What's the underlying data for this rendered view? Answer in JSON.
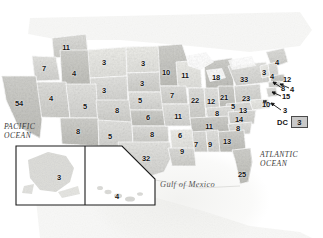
{
  "map": {
    "title": "United States Electoral College Map",
    "geo_labels": [
      {
        "name": "pacific-ocean",
        "line1": "PACIFIC",
        "line2": "OCEAN",
        "x": 4,
        "y": 122
      },
      {
        "name": "atlantic-ocean",
        "line1": "ATLANTIC",
        "line2": "OCEAN",
        "x": 260,
        "y": 150
      },
      {
        "name": "gulf-of-mexico",
        "line1": "Gulf of Mexico",
        "line2": "",
        "x": 160,
        "y": 180
      }
    ],
    "dc": {
      "label": "DC",
      "value": "3"
    },
    "insets": [
      {
        "name": "alaska-inset",
        "value": "3"
      },
      {
        "name": "hawaii-inset",
        "value": "4"
      }
    ],
    "states": [
      {
        "code": "WA",
        "value": "11",
        "x": 66,
        "y": 47
      },
      {
        "code": "MT",
        "value": "3",
        "x": 104,
        "y": 62
      },
      {
        "code": "ND",
        "value": "3",
        "x": 143,
        "y": 63
      },
      {
        "code": "MN",
        "value": "10",
        "x": 166,
        "y": 72
      },
      {
        "code": "OR",
        "value": "7",
        "x": 44,
        "y": 68
      },
      {
        "code": "ID",
        "value": "4",
        "x": 74,
        "y": 73
      },
      {
        "code": "WY",
        "value": "3",
        "x": 104,
        "y": 90
      },
      {
        "code": "SD",
        "value": "3",
        "x": 142,
        "y": 83
      },
      {
        "code": "NE",
        "value": "5",
        "x": 140,
        "y": 100
      },
      {
        "code": "IA",
        "value": "7",
        "x": 172,
        "y": 95
      },
      {
        "code": "WI",
        "value": "11",
        "x": 185,
        "y": 75
      },
      {
        "code": "MI",
        "value": "18",
        "x": 216,
        "y": 77
      },
      {
        "code": "CA",
        "value": "54",
        "x": 19,
        "y": 103
      },
      {
        "code": "NV",
        "value": "4",
        "x": 51,
        "y": 98
      },
      {
        "code": "UT",
        "value": "5",
        "x": 85,
        "y": 106
      },
      {
        "code": "CO",
        "value": "8",
        "x": 117,
        "y": 110
      },
      {
        "code": "KS",
        "value": "6",
        "x": 148,
        "y": 117
      },
      {
        "code": "MO",
        "value": "11",
        "x": 178,
        "y": 116
      },
      {
        "code": "IL",
        "value": "22",
        "x": 195,
        "y": 100
      },
      {
        "code": "IN",
        "value": "12",
        "x": 211,
        "y": 101
      },
      {
        "code": "OH",
        "value": "21",
        "x": 224,
        "y": 97
      },
      {
        "code": "PA",
        "value": "23",
        "x": 246,
        "y": 98
      },
      {
        "code": "NY",
        "value": "33",
        "x": 244,
        "y": 79
      },
      {
        "code": "AZ",
        "value": "8",
        "x": 78,
        "y": 131
      },
      {
        "code": "NM",
        "value": "5",
        "x": 110,
        "y": 136
      },
      {
        "code": "OK",
        "value": "8",
        "x": 152,
        "y": 134
      },
      {
        "code": "AR",
        "value": "6",
        "x": 180,
        "y": 135
      },
      {
        "code": "TX",
        "value": "32",
        "x": 146,
        "y": 158
      },
      {
        "code": "LA",
        "value": "9",
        "x": 182,
        "y": 151
      },
      {
        "code": "MS",
        "value": "7",
        "x": 196,
        "y": 144
      },
      {
        "code": "AL",
        "value": "9",
        "x": 210,
        "y": 144
      },
      {
        "code": "TN",
        "value": "11",
        "x": 209,
        "y": 126
      },
      {
        "code": "KY",
        "value": "8",
        "x": 217,
        "y": 113
      },
      {
        "code": "GA",
        "value": "13",
        "x": 227,
        "y": 141
      },
      {
        "code": "FL",
        "value": "25",
        "x": 242,
        "y": 174
      },
      {
        "code": "SC",
        "value": "8",
        "x": 238,
        "y": 128
      },
      {
        "code": "NC",
        "value": "14",
        "x": 239,
        "y": 119
      },
      {
        "code": "VA",
        "value": "13",
        "x": 243,
        "y": 110
      },
      {
        "code": "WV",
        "value": "5",
        "x": 233,
        "y": 106
      },
      {
        "code": "ME",
        "value": "4",
        "x": 277,
        "y": 62
      },
      {
        "code": "VT",
        "value": "3",
        "x": 264,
        "y": 72
      },
      {
        "code": "NH",
        "value": "4",
        "x": 272,
        "y": 76
      },
      {
        "code": "MA",
        "value": "12",
        "x": 287,
        "y": 79
      },
      {
        "code": "RI",
        "value": "4",
        "x": 292,
        "y": 89
      },
      {
        "code": "CT",
        "value": "8",
        "x": 283,
        "y": 88
      },
      {
        "code": "NJ",
        "value": "15",
        "x": 286,
        "y": 96
      },
      {
        "code": "DE",
        "value": "3",
        "x": 285,
        "y": 110
      },
      {
        "code": "MD",
        "value": "10",
        "x": 266,
        "y": 104
      }
    ],
    "leaders": [
      {
        "name": "leader-ct",
        "x1": 282,
        "y1": 88,
        "x2": 273,
        "y2": 82
      },
      {
        "name": "leader-ri",
        "x1": 289,
        "y1": 88,
        "x2": 280,
        "y2": 84
      },
      {
        "name": "leader-nj",
        "x1": 281,
        "y1": 96,
        "x2": 272,
        "y2": 92
      },
      {
        "name": "leader-de",
        "x1": 281,
        "y1": 110,
        "x2": 271,
        "y2": 103
      },
      {
        "name": "leader-md",
        "x1": 271,
        "y1": 104,
        "x2": 263,
        "y2": 101
      }
    ]
  }
}
